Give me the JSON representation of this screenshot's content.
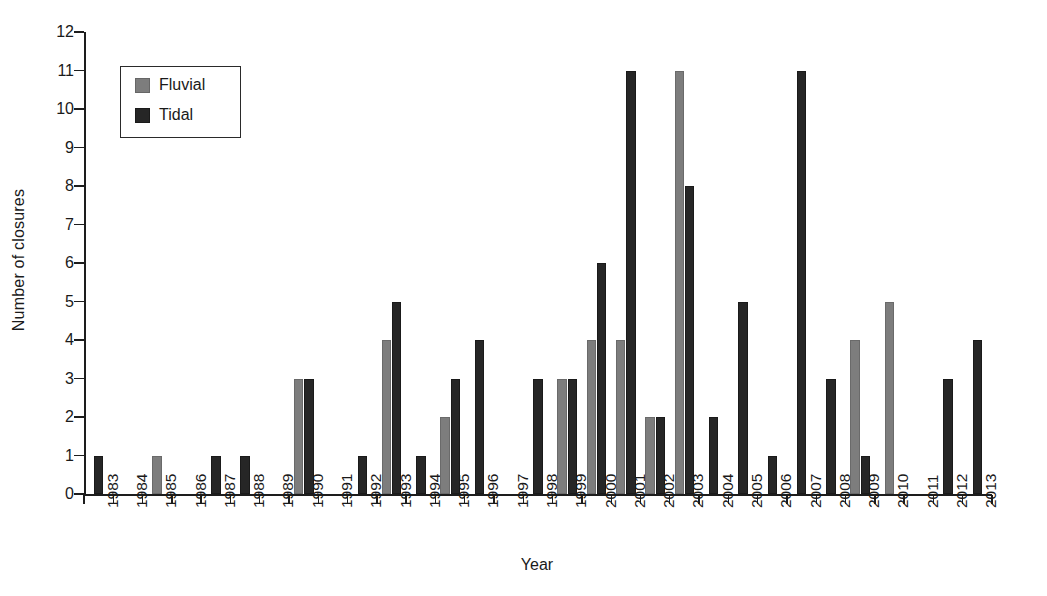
{
  "chart_data": {
    "type": "bar",
    "title": "",
    "xlabel": "Year",
    "ylabel": "Number of closures",
    "ylim": [
      0,
      12
    ],
    "ytick_step": 1,
    "grid": false,
    "legend_position": "top-left",
    "bar_mode": "grouped",
    "categories": [
      "1983",
      "1984",
      "1985",
      "1986",
      "1987",
      "1988",
      "1989",
      "1990",
      "1991",
      "1992",
      "1993",
      "1994",
      "1995",
      "1996",
      "1997",
      "1998",
      "1999",
      "2000",
      "2001",
      "2002",
      "2003",
      "2004",
      "2005",
      "2006",
      "2007",
      "2008",
      "2009",
      "2010",
      "2011",
      "2012",
      "2013"
    ],
    "yticks": [
      "0",
      "1",
      "2",
      "3",
      "4",
      "5",
      "6",
      "7",
      "8",
      "9",
      "10",
      "11",
      "12"
    ],
    "series": [
      {
        "name": "Fluvial",
        "color": "#7d7d7d",
        "values": [
          0,
          0,
          1,
          0,
          0,
          0,
          0,
          3,
          0,
          0,
          4,
          0,
          2,
          0,
          0,
          0,
          3,
          4,
          4,
          2,
          11,
          0,
          0,
          0,
          0,
          0,
          4,
          5,
          0,
          0,
          0
        ]
      },
      {
        "name": "Tidal",
        "color": "#262626",
        "values": [
          1,
          0,
          0,
          0,
          1,
          1,
          0,
          3,
          0,
          1,
          5,
          1,
          3,
          4,
          0,
          3,
          3,
          6,
          11,
          2,
          8,
          2,
          5,
          1,
          11,
          3,
          1,
          0,
          0,
          3,
          4
        ]
      }
    ]
  },
  "legend": {
    "entries": [
      {
        "label": "Fluvial",
        "swatch": "fluvial-swatch"
      },
      {
        "label": "Tidal",
        "swatch": "tidal-swatch"
      }
    ]
  },
  "axes": {
    "y_title": "Number of closures",
    "x_title": "Year"
  }
}
